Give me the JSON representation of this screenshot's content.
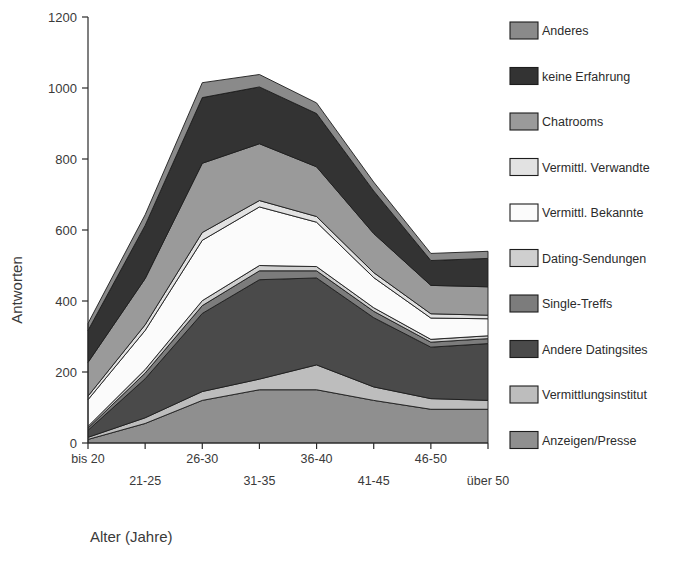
{
  "chart_data": {
    "type": "area",
    "title": "",
    "xlabel": "Alter (Jahre)",
    "ylabel": "Antworten",
    "ylim": [
      0,
      1200
    ],
    "yticks": [
      0,
      200,
      400,
      600,
      800,
      1000,
      1200
    ],
    "ytick_labels": [
      "0",
      "200",
      "400",
      "600",
      "800",
      "1000",
      "1200"
    ],
    "grid": false,
    "stacked": true,
    "legend_position": "right",
    "categories": [
      "bis 20",
      "21-25",
      "26-30",
      "31-35",
      "36-40",
      "41-45",
      "46-50",
      "über 50"
    ],
    "series": [
      {
        "name": "Anzeigen/Presse",
        "color": "#8f8f8f",
        "values": [
          10,
          55,
          120,
          150,
          150,
          120,
          95,
          95
        ]
      },
      {
        "name": "Vermittlungsinstitut",
        "color": "#bdbdbd",
        "values": [
          6,
          16,
          25,
          30,
          70,
          38,
          30,
          25
        ]
      },
      {
        "name": "Andere Datingsites",
        "color": "#4a4a4a",
        "values": [
          20,
          110,
          220,
          280,
          245,
          195,
          145,
          160
        ]
      },
      {
        "name": "Single-Treffs",
        "color": "#7c7c7c",
        "values": [
          6,
          16,
          22,
          25,
          20,
          18,
          14,
          14
        ]
      },
      {
        "name": "Dating-Sendungen",
        "color": "#cfcfcf",
        "values": [
          5,
          10,
          14,
          15,
          12,
          10,
          8,
          8
        ]
      },
      {
        "name": "Vermittl. Bekannte",
        "color": "#fbfbfb",
        "values": [
          75,
          110,
          170,
          165,
          125,
          85,
          60,
          48
        ]
      },
      {
        "name": "Vermittl. Verwandte",
        "color": "#e2e2e2",
        "values": [
          10,
          16,
          22,
          18,
          16,
          14,
          12,
          10
        ]
      },
      {
        "name": "Chatrooms",
        "color": "#9a9a9a",
        "values": [
          95,
          130,
          195,
          160,
          140,
          110,
          80,
          80
        ]
      },
      {
        "name": "keine Erfahrung",
        "color": "#333333",
        "values": [
          90,
          150,
          185,
          160,
          150,
          120,
          70,
          80
        ]
      },
      {
        "name": "Anderes",
        "color": "#8a8a8a",
        "values": [
          20,
          30,
          42,
          35,
          30,
          25,
          20,
          20
        ]
      }
    ]
  },
  "legend": {
    "items": [
      {
        "label": "Anderes",
        "color": "#8a8a8a"
      },
      {
        "label": "keine Erfahrung",
        "color": "#333333"
      },
      {
        "label": "Chatrooms",
        "color": "#9a9a9a"
      },
      {
        "label": "Vermittl. Verwandte",
        "color": "#e2e2e2"
      },
      {
        "label": "Vermittl. Bekannte",
        "color": "#fbfbfb"
      },
      {
        "label": "Dating-Sendungen",
        "color": "#cfcfcf"
      },
      {
        "label": "Single-Treffs",
        "color": "#7c7c7c"
      },
      {
        "label": "Andere Datingsites",
        "color": "#4a4a4a"
      },
      {
        "label": "Vermittlungsinstitut",
        "color": "#bdbdbd"
      },
      {
        "label": "Anzeigen/Presse",
        "color": "#8f8f8f"
      }
    ]
  },
  "axes": {
    "y_title": "Antworten",
    "x_title": "Alter (Jahre)"
  }
}
